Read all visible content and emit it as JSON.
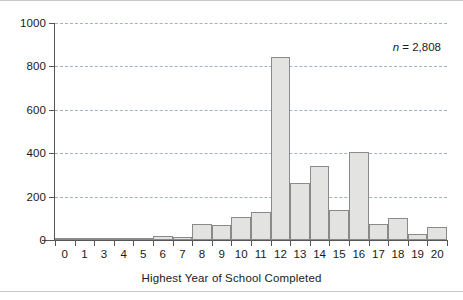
{
  "chart_data": {
    "type": "bar",
    "title": "",
    "xlabel": "Highest Year of School Completed",
    "ylabel": "",
    "categories": [
      "0",
      "1",
      "3",
      "4",
      "5",
      "6",
      "7",
      "8",
      "9",
      "10",
      "11",
      "12",
      "13",
      "14",
      "15",
      "16",
      "17",
      "18",
      "19",
      "20"
    ],
    "values": [
      2,
      2,
      6,
      3,
      3,
      18,
      15,
      75,
      68,
      105,
      130,
      845,
      262,
      342,
      140,
      405,
      75,
      100,
      30,
      60
    ],
    "ylim": [
      0,
      1000
    ],
    "yticks": [
      0,
      200,
      400,
      600,
      800,
      1000
    ],
    "ytick_labels": [
      "0",
      "200",
      "400",
      "600",
      "800",
      "1000"
    ],
    "grid": "horizontal-dashed",
    "legend": "none",
    "annotations": [
      {
        "symbol": "n",
        "text": " = 2,808",
        "full": "n = 2,808"
      }
    ],
    "bar_fill": "#e3e3e1",
    "bar_stroke": "#8a8a8a",
    "gridline_color": "#9fb3c8",
    "axis_color": "#555555"
  },
  "figure": {
    "annotation_symbol": "n",
    "annotation_value": " = 2,808",
    "axis_title": "Highest Year of School Completed"
  }
}
